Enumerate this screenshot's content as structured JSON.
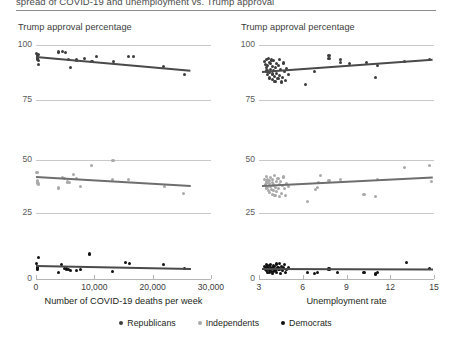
{
  "figure": {
    "cut_title": "spread of COVID-19 and unemployment vs. Trump approval",
    "legend": [
      {
        "label": "Republicans",
        "color": "#3d3d3d"
      },
      {
        "label": "Independents",
        "color": "#a9a9a9"
      },
      {
        "label": "Democrats",
        "color": "#111111"
      }
    ]
  },
  "chart_data": {
    "type": "scatter",
    "grid": true,
    "legend_position": "bottom",
    "columns": [
      {
        "id": "deaths",
        "title": "Trump approval percentage",
        "xlabel": "Number of COVID-19 deaths per week",
        "xlim": [
          0,
          30000
        ],
        "xticks": [
          0,
          10000,
          20000,
          30000
        ],
        "xticklabels": [
          "0",
          "10,000",
          "20,000",
          "30,000"
        ]
      },
      {
        "id": "unemployment",
        "title": "Trump approval percentage",
        "xlabel": "Unemployment rate",
        "xlim": [
          3,
          15
        ],
        "xticks": [
          3,
          6,
          9,
          12,
          15
        ],
        "xticklabels": [
          "3",
          "6",
          "9",
          "12",
          "15"
        ]
      }
    ],
    "rows": [
      {
        "id": "republicans",
        "group": "Republicans",
        "color": "#3d3d3d",
        "ylim": [
          75,
          100
        ],
        "yticks": [
          75,
          100
        ],
        "yticklabels": [
          "75",
          "100"
        ]
      },
      {
        "id": "independents",
        "group": "Independents",
        "color": "#a9a9a9",
        "ylim": [
          25,
          50
        ],
        "yticks": [
          25,
          50
        ],
        "yticklabels": [
          "25",
          "50"
        ]
      },
      {
        "id": "democrats",
        "group": "Democrats",
        "color": "#111111",
        "ylim": [
          0,
          25
        ],
        "yticks": [
          0
        ],
        "yticklabels": [
          "0"
        ]
      }
    ],
    "panels": [
      {
        "row": "republicans",
        "column": "deaths",
        "fit": {
          "x0": 0,
          "y0": 94.6,
          "x1": 26500,
          "y1": 88.3
        },
        "points": [
          [
            150,
            96.0
          ],
          [
            200,
            95.2
          ],
          [
            260,
            94.6
          ],
          [
            300,
            94.1
          ],
          [
            330,
            93.4
          ],
          [
            380,
            92.8
          ],
          [
            420,
            95.6
          ],
          [
            470,
            91.0
          ],
          [
            3900,
            96.8
          ],
          [
            4600,
            97.2
          ],
          [
            5100,
            96.6
          ],
          [
            5600,
            93.6
          ],
          [
            5900,
            89.6
          ],
          [
            7000,
            93.2
          ],
          [
            8300,
            93.8
          ],
          [
            9600,
            92.6
          ],
          [
            10400,
            94.6
          ],
          [
            13300,
            92.4
          ],
          [
            15900,
            94.8
          ],
          [
            16700,
            94.7
          ],
          [
            21900,
            90.4
          ],
          [
            25400,
            86.4
          ]
        ]
      },
      {
        "row": "independents",
        "column": "deaths",
        "fit": {
          "x0": 0,
          "y0": 41.8,
          "x1": 26500,
          "y1": 37.6
        },
        "points": [
          [
            150,
            44.2
          ],
          [
            210,
            44.0
          ],
          [
            260,
            40.4
          ],
          [
            300,
            39.6
          ],
          [
            340,
            38.8
          ],
          [
            400,
            38.4
          ],
          [
            3800,
            36.8
          ],
          [
            4500,
            41.6
          ],
          [
            4900,
            41.4
          ],
          [
            5400,
            39.6
          ],
          [
            5700,
            39.2
          ],
          [
            6400,
            43.0
          ],
          [
            6900,
            41.2
          ],
          [
            7600,
            37.6
          ],
          [
            9500,
            47.4
          ],
          [
            13100,
            41.0
          ],
          [
            13200,
            49.6
          ],
          [
            15800,
            40.8
          ],
          [
            22000,
            37.6
          ],
          [
            25300,
            34.4
          ]
        ]
      },
      {
        "row": "democrats",
        "column": "deaths",
        "fit": {
          "x0": 0,
          "y0": 6.6,
          "x1": 26500,
          "y1": 5.0
        },
        "points": [
          [
            150,
            8.0
          ],
          [
            200,
            6.6
          ],
          [
            240,
            6.2
          ],
          [
            280,
            5.8
          ],
          [
            320,
            5.2
          ],
          [
            360,
            11.0
          ],
          [
            3800,
            3.6
          ],
          [
            4400,
            7.6
          ],
          [
            4900,
            5.6
          ],
          [
            5300,
            5.2
          ],
          [
            5600,
            5.0
          ],
          [
            5900,
            4.4
          ],
          [
            6900,
            4.6
          ],
          [
            7600,
            5.0
          ],
          [
            9200,
            13.0
          ],
          [
            13100,
            4.0
          ],
          [
            15400,
            8.6
          ],
          [
            16100,
            8.0
          ],
          [
            21800,
            7.4
          ],
          [
            25400,
            5.4
          ]
        ]
      },
      {
        "row": "republicans",
        "column": "unemployment",
        "fit": {
          "x0": 3.2,
          "y0": 87.6,
          "x1": 14.9,
          "y1": 93.2
        },
        "points": [
          [
            3.4,
            92.4
          ],
          [
            3.45,
            91.0
          ],
          [
            3.5,
            93.6
          ],
          [
            3.5,
            89.6
          ],
          [
            3.55,
            88.2
          ],
          [
            3.6,
            90.8
          ],
          [
            3.6,
            86.4
          ],
          [
            3.65,
            94.0
          ],
          [
            3.7,
            92.0
          ],
          [
            3.7,
            87.4
          ],
          [
            3.75,
            85.0
          ],
          [
            3.8,
            91.6
          ],
          [
            3.8,
            89.0
          ],
          [
            3.85,
            93.2
          ],
          [
            3.9,
            86.8
          ],
          [
            3.9,
            84.2
          ],
          [
            3.95,
            90.2
          ],
          [
            4.0,
            88.4
          ],
          [
            4.0,
            92.8
          ],
          [
            4.05,
            85.8
          ],
          [
            4.1,
            83.6
          ],
          [
            4.15,
            89.8
          ],
          [
            4.2,
            91.4
          ],
          [
            4.2,
            87.0
          ],
          [
            4.3,
            84.8
          ],
          [
            4.35,
            90.6
          ],
          [
            4.4,
            86.2
          ],
          [
            4.4,
            93.4
          ],
          [
            4.5,
            88.8
          ],
          [
            4.55,
            83.2
          ],
          [
            4.6,
            85.4
          ],
          [
            4.7,
            91.8
          ],
          [
            4.75,
            87.8
          ],
          [
            4.8,
            84.0
          ],
          [
            4.9,
            89.2
          ],
          [
            5.0,
            86.6
          ],
          [
            6.2,
            82.2
          ],
          [
            6.8,
            88.0
          ],
          [
            7.8,
            93.8
          ],
          [
            7.8,
            95.2
          ],
          [
            8.6,
            93.4
          ],
          [
            8.6,
            92.0
          ],
          [
            9.2,
            91.4
          ],
          [
            10.4,
            92.0
          ],
          [
            11.0,
            85.4
          ],
          [
            11.1,
            90.6
          ],
          [
            13.0,
            92.4
          ],
          [
            14.7,
            93.6
          ]
        ]
      },
      {
        "row": "independents",
        "column": "unemployment",
        "fit": {
          "x0": 3.2,
          "y0": 37.6,
          "x1": 14.9,
          "y1": 41.6
        },
        "points": [
          [
            3.4,
            40.6
          ],
          [
            3.45,
            38.4
          ],
          [
            3.5,
            42.4
          ],
          [
            3.5,
            36.8
          ],
          [
            3.55,
            39.6
          ],
          [
            3.6,
            37.2
          ],
          [
            3.6,
            41.0
          ],
          [
            3.65,
            35.4
          ],
          [
            3.7,
            38.8
          ],
          [
            3.7,
            40.2
          ],
          [
            3.75,
            34.6
          ],
          [
            3.8,
            37.6
          ],
          [
            3.8,
            41.8
          ],
          [
            3.85,
            36.0
          ],
          [
            3.9,
            39.2
          ],
          [
            3.9,
            33.8
          ],
          [
            3.95,
            40.8
          ],
          [
            4.0,
            35.8
          ],
          [
            4.0,
            38.2
          ],
          [
            4.05,
            42.8
          ],
          [
            4.1,
            33.2
          ],
          [
            4.15,
            37.0
          ],
          [
            4.2,
            39.8
          ],
          [
            4.2,
            35.0
          ],
          [
            4.3,
            41.4
          ],
          [
            4.35,
            36.4
          ],
          [
            4.4,
            38.6
          ],
          [
            4.4,
            32.8
          ],
          [
            4.5,
            40.0
          ],
          [
            4.55,
            34.2
          ],
          [
            4.6,
            37.8
          ],
          [
            4.7,
            42.0
          ],
          [
            4.75,
            36.6
          ],
          [
            4.8,
            33.4
          ],
          [
            4.9,
            39.0
          ],
          [
            5.0,
            37.4
          ],
          [
            6.3,
            30.6
          ],
          [
            6.9,
            36.2
          ],
          [
            7.0,
            37.0
          ],
          [
            7.1,
            39.4
          ],
          [
            7.2,
            42.6
          ],
          [
            7.8,
            40.4
          ],
          [
            8.6,
            40.6
          ],
          [
            10.2,
            33.8
          ],
          [
            11.0,
            32.6
          ],
          [
            11.1,
            40.8
          ],
          [
            13.0,
            46.4
          ],
          [
            14.7,
            47.6
          ],
          [
            14.8,
            39.8
          ]
        ]
      },
      {
        "row": "democrats",
        "column": "unemployment",
        "fit": {
          "x0": 3.2,
          "y0": 5.4,
          "x1": 14.9,
          "y1": 5.2
        },
        "points": [
          [
            3.4,
            6.6
          ],
          [
            3.45,
            5.2
          ],
          [
            3.5,
            7.4
          ],
          [
            3.5,
            4.2
          ],
          [
            3.55,
            6.0
          ],
          [
            3.6,
            3.6
          ],
          [
            3.6,
            7.0
          ],
          [
            3.65,
            5.6
          ],
          [
            3.7,
            4.6
          ],
          [
            3.7,
            6.8
          ],
          [
            3.75,
            3.2
          ],
          [
            3.8,
            5.8
          ],
          [
            3.8,
            7.6
          ],
          [
            3.85,
            4.0
          ],
          [
            3.9,
            6.2
          ],
          [
            3.9,
            2.8
          ],
          [
            3.95,
            5.4
          ],
          [
            4.0,
            7.2
          ],
          [
            4.0,
            3.8
          ],
          [
            4.05,
            6.4
          ],
          [
            4.1,
            4.4
          ],
          [
            4.15,
            5.0
          ],
          [
            4.2,
            7.8
          ],
          [
            4.2,
            3.4
          ],
          [
            4.3,
            6.0
          ],
          [
            4.35,
            4.8
          ],
          [
            4.4,
            5.2
          ],
          [
            4.4,
            8.0
          ],
          [
            4.5,
            3.0
          ],
          [
            4.55,
            6.6
          ],
          [
            4.6,
            4.2
          ],
          [
            4.7,
            5.8
          ],
          [
            4.75,
            7.4
          ],
          [
            4.8,
            3.6
          ],
          [
            4.9,
            5.0
          ],
          [
            5.0,
            6.2
          ],
          [
            6.3,
            3.4
          ],
          [
            6.8,
            3.0
          ],
          [
            7.0,
            3.2
          ],
          [
            7.8,
            5.2
          ],
          [
            8.4,
            3.4
          ],
          [
            10.2,
            3.2
          ],
          [
            11.0,
            2.6
          ],
          [
            11.1,
            3.6
          ],
          [
            13.1,
            8.4
          ],
          [
            14.7,
            5.6
          ]
        ]
      }
    ]
  }
}
